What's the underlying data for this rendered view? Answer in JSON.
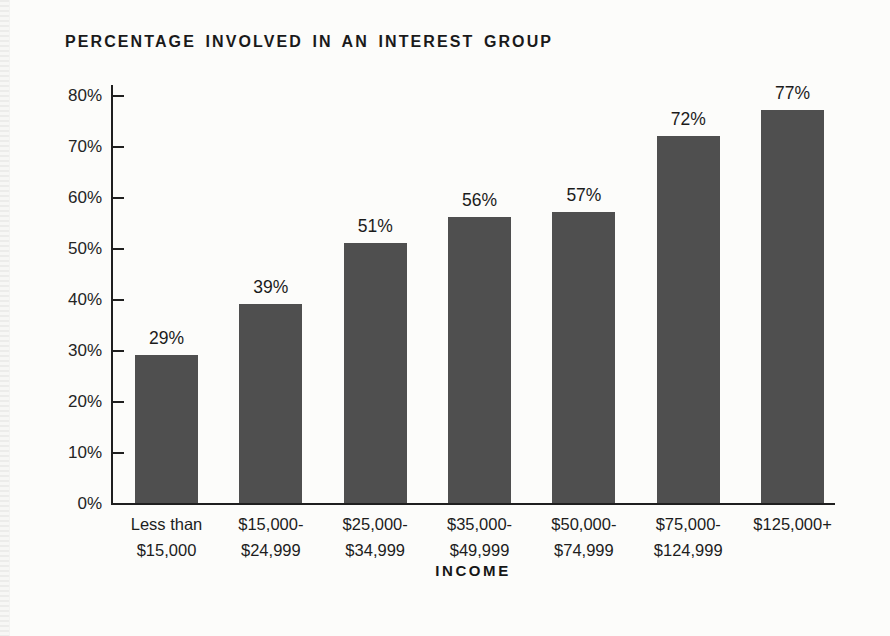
{
  "chart_data": {
    "type": "bar",
    "title": "PERCENTAGE INVOLVED IN AN INTEREST GROUP",
    "xlabel": "INCOME",
    "ylabel": "",
    "categories": [
      "Less than $15,000",
      "$15,000-$24,999",
      "$25,000-$34,999",
      "$35,000-$49,999",
      "$50,000-$74,999",
      "$75,000-$124,999",
      "$125,000+"
    ],
    "category_lines": [
      [
        "Less than",
        "$15,000"
      ],
      [
        "$15,000-",
        "$24,999"
      ],
      [
        "$25,000-",
        "$34,999"
      ],
      [
        "$35,000-",
        "$49,999"
      ],
      [
        "$50,000-",
        "$74,999"
      ],
      [
        "$75,000-",
        "$124,999"
      ],
      [
        "$125,000+"
      ]
    ],
    "values": [
      29,
      39,
      51,
      56,
      57,
      72,
      77
    ],
    "value_labels": [
      "29%",
      "39%",
      "51%",
      "56%",
      "57%",
      "72%",
      "77%"
    ],
    "ylim": [
      0,
      80
    ],
    "ytick_step": 10,
    "ytick_labels": [
      "0%",
      "10%",
      "20%",
      "30%",
      "40%",
      "50%",
      "60%",
      "70%",
      "80%"
    ],
    "grid": false,
    "legend": "none",
    "colors": {
      "bar": "#4f4f4f",
      "axis": "#1f1f1f",
      "text": "#1d1d1d",
      "background": "#fcfcfa",
      "page_edge": "#ececea"
    }
  }
}
